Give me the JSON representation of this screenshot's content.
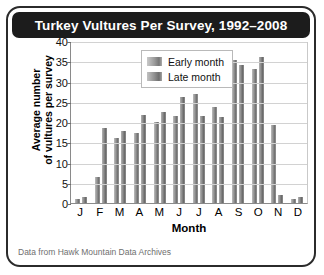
{
  "chart_data": {
    "type": "bar",
    "title": "Turkey Vultures Per Survey, 1992–2008",
    "xlabel": "Month",
    "ylabel": "Average number\nof vultures per survey",
    "ylabel_line1": "Average number",
    "ylabel_line2": "of vultures per survey",
    "categories": [
      "J",
      "F",
      "M",
      "A",
      "M",
      "J",
      "J",
      "A",
      "S",
      "O",
      "N",
      "D"
    ],
    "ylim": [
      0,
      40
    ],
    "yticks": [
      0,
      5,
      10,
      15,
      20,
      25,
      30,
      35,
      40
    ],
    "grid": true,
    "legend_position": "top-left-inside",
    "series": [
      {
        "name": "Early month",
        "values": [
          1.0,
          6.5,
          16.0,
          17.2,
          20.0,
          21.5,
          27.0,
          23.8,
          35.2,
          33.0,
          19.3,
          1.0
        ]
      },
      {
        "name": "Late month",
        "values": [
          1.5,
          18.5,
          17.8,
          21.7,
          22.5,
          26.2,
          21.5,
          21.2,
          34.0,
          36.0,
          2.0,
          1.5
        ]
      }
    ],
    "annotation": "Data from Hawk Mountain Data Archives"
  },
  "legend": {
    "items": [
      {
        "label": "Early month"
      },
      {
        "label": "Late month"
      }
    ]
  }
}
